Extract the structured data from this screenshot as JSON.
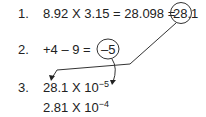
{
  "steps": [
    {
      "number": "1.",
      "expression": "8.92 X 3.15 = 28.098 =",
      "result": "28.1"
    },
    {
      "number": "2.",
      "expression": "+4 – 9 =",
      "result": "–5"
    },
    {
      "number": "3.",
      "mantissa": "28.1 X 10",
      "exponent": "−5"
    }
  ],
  "final": {
    "mantissa": "2.81 X 10",
    "exponent": "−4"
  }
}
